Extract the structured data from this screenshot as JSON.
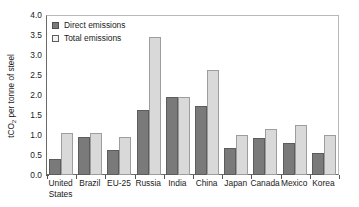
{
  "chart_data": {
    "type": "bar",
    "title": "",
    "xlabel": "",
    "ylabel": "tCO2 per tonne of steel",
    "ylabel_parts": {
      "prefix": "tCO",
      "sub": "2",
      "suffix": " per tonne of steel"
    },
    "ylim": [
      0.0,
      4.0
    ],
    "y_ticks": [
      "0.0",
      "0.5",
      "1.0",
      "1.5",
      "2.0",
      "2.5",
      "3.0",
      "3.5",
      "4.0"
    ],
    "y_tick_values": [
      0.0,
      0.5,
      1.0,
      1.5,
      2.0,
      2.5,
      3.0,
      3.5,
      4.0
    ],
    "grid": false,
    "legend_position": "top-left",
    "categories": [
      "United States",
      "Brazil",
      "EU-25",
      "Russia",
      "India",
      "China",
      "Japan",
      "Canada",
      "Mexico",
      "Korea"
    ],
    "category_lines": [
      [
        "United",
        "States"
      ],
      [
        "Brazil",
        ""
      ],
      [
        "EU-25",
        ""
      ],
      [
        "Russia",
        ""
      ],
      [
        "India",
        ""
      ],
      [
        "China",
        ""
      ],
      [
        "Japan",
        ""
      ],
      [
        "Canada",
        ""
      ],
      [
        "Mexico",
        ""
      ],
      [
        "Korea",
        ""
      ]
    ],
    "series": [
      {
        "name": "Direct emissions",
        "color": "#7a7a7a",
        "values": [
          0.4,
          0.94,
          0.62,
          1.63,
          1.95,
          1.72,
          0.68,
          0.92,
          0.8,
          0.55
        ]
      },
      {
        "name": "Total emissions",
        "color": "#d9d9d9",
        "values": [
          1.04,
          1.05,
          0.94,
          3.45,
          1.95,
          2.62,
          1.0,
          1.15,
          1.26,
          1.0
        ]
      }
    ]
  },
  "legend": {
    "entries": [
      {
        "label": "Direct emissions",
        "swatch": "direct"
      },
      {
        "label": "Total emissions",
        "swatch": "total"
      }
    ]
  },
  "colors": {
    "direct_bar": "#7a7a7a",
    "direct_bar_border": "#5c5c5c",
    "total_bar": "#d9d9d9",
    "total_bar_border": "#9d9d9d",
    "axis": "#6b6b6b",
    "frame_light": "#b9b9b9",
    "background": "#ffffff",
    "text": "#1a1a1a"
  }
}
